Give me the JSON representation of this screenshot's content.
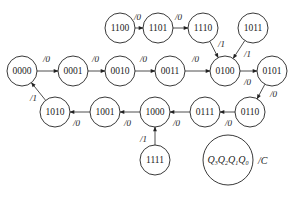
{
  "diagram": {
    "type": "state-diagram",
    "nodes": [
      {
        "id": "1100",
        "label": "1100",
        "x": 120,
        "y": 28
      },
      {
        "id": "1101",
        "label": "1101",
        "x": 158,
        "y": 28
      },
      {
        "id": "1110",
        "label": "1110",
        "x": 203,
        "y": 28
      },
      {
        "id": "1011",
        "label": "1011",
        "x": 253,
        "y": 28
      },
      {
        "id": "0000",
        "label": "0000",
        "x": 22,
        "y": 71
      },
      {
        "id": "0001",
        "label": "0001",
        "x": 73,
        "y": 71
      },
      {
        "id": "0010",
        "label": "0010",
        "x": 120,
        "y": 71
      },
      {
        "id": "0011",
        "label": "0011",
        "x": 170,
        "y": 71
      },
      {
        "id": "0100",
        "label": "0100",
        "x": 225,
        "y": 71
      },
      {
        "id": "0101",
        "label": "0101",
        "x": 272,
        "y": 71
      },
      {
        "id": "0110",
        "label": "0110",
        "x": 250,
        "y": 112
      },
      {
        "id": "0111",
        "label": "0111",
        "x": 205,
        "y": 112
      },
      {
        "id": "1000",
        "label": "1000",
        "x": 155,
        "y": 112
      },
      {
        "id": "1001",
        "label": "1001",
        "x": 105,
        "y": 112
      },
      {
        "id": "1010",
        "label": "1010",
        "x": 55,
        "y": 112
      },
      {
        "id": "1111",
        "label": "1111",
        "x": 155,
        "y": 160
      }
    ],
    "edges": [
      {
        "from": "1100",
        "to": "1101",
        "label": "/0",
        "lx": 134,
        "ly": 20
      },
      {
        "from": "1101",
        "to": "1110",
        "label": "/0",
        "lx": 175,
        "ly": 20
      },
      {
        "from": "1110",
        "to": "0100",
        "label": "/1",
        "lx": 218,
        "ly": 47
      },
      {
        "from": "1011",
        "to": "0100",
        "label": "/1",
        "lx": 244,
        "ly": 57
      },
      {
        "from": "0000",
        "to": "0001",
        "label": "/0",
        "lx": 43,
        "ly": 62
      },
      {
        "from": "0001",
        "to": "0010",
        "label": "/0",
        "lx": 92,
        "ly": 62
      },
      {
        "from": "0010",
        "to": "0011",
        "label": "/0",
        "lx": 140,
        "ly": 62
      },
      {
        "from": "0011",
        "to": "0100",
        "label": "/0",
        "lx": 192,
        "ly": 62
      },
      {
        "from": "0100",
        "to": "0101",
        "label": "/0",
        "lx": 244,
        "ly": 85
      },
      {
        "from": "0101",
        "to": "0110",
        "label": "/0",
        "lx": 270,
        "ly": 97
      },
      {
        "from": "0110",
        "to": "0111",
        "label": "/0",
        "lx": 225,
        "ly": 126
      },
      {
        "from": "0111",
        "to": "1000",
        "label": "/0",
        "lx": 173,
        "ly": 126
      },
      {
        "from": "1000",
        "to": "1001",
        "label": "/0",
        "lx": 124,
        "ly": 126
      },
      {
        "from": "1001",
        "to": "1010",
        "label": "/0",
        "lx": 73,
        "ly": 126
      },
      {
        "from": "1010",
        "to": "0000",
        "label": "/1",
        "lx": 30,
        "ly": 101
      },
      {
        "from": "1111",
        "to": "1000",
        "label": "/1",
        "lx": 140,
        "ly": 142
      }
    ],
    "legend": {
      "state_label": "Q3Q2Q1Q0",
      "bits": [
        "Q",
        "3",
        "Q",
        "2",
        "Q",
        "1",
        "Q",
        "0"
      ],
      "output_label": "/C"
    }
  }
}
